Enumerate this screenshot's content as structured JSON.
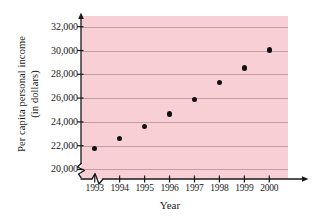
{
  "chart_data": {
    "type": "scatter",
    "title": "",
    "xlabel": "Year",
    "ylabel_line1": "Per capita personal income",
    "ylabel_line2": "(in dollars)",
    "categories": [
      "1993",
      "1994",
      "1995",
      "1996",
      "1997",
      "1998",
      "1999",
      "2000"
    ],
    "x": [
      1993,
      1994,
      1995,
      1996,
      1997,
      1998,
      1999,
      2000
    ],
    "values": [
      21750,
      22600,
      23600,
      24650,
      25900,
      27300,
      28550,
      30050
    ],
    "ytick_labels": [
      "20,000",
      "22,000",
      "24,000",
      "26,000",
      "28,000",
      "30,000",
      "32,000"
    ],
    "ytick_values": [
      20000,
      22000,
      24000,
      26000,
      28000,
      30000,
      32000
    ],
    "ylim": [
      19200,
      32900
    ],
    "xlim": [
      1992.45,
      2000.75
    ],
    "grid": true,
    "legend": null,
    "axis_break_x": true,
    "axis_break_y": true,
    "plot_background_color": "#f9cfd6",
    "gridline_color": "#b08a90",
    "marker_color": "#111111",
    "axis_color": "#1a1a1a"
  }
}
